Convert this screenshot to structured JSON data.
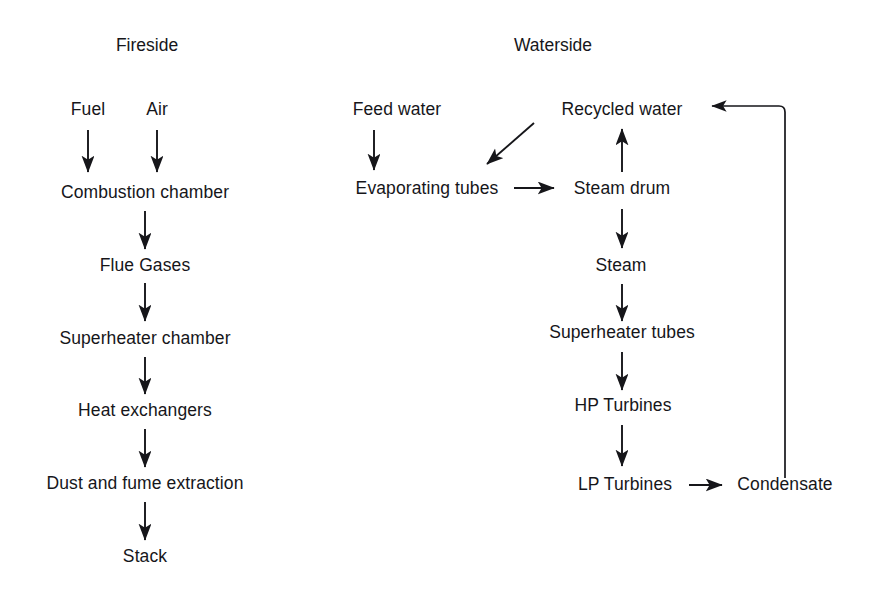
{
  "diagram": {
    "title_fireside": "Fireside",
    "title_waterside": "Waterside",
    "fireside": {
      "inputs": [
        {
          "label": "Fuel"
        },
        {
          "label": "Air"
        }
      ],
      "chain": [
        {
          "label": "Combustion chamber"
        },
        {
          "label": "Flue Gases"
        },
        {
          "label": "Superheater chamber"
        },
        {
          "label": "Heat exchangers"
        },
        {
          "label": "Dust and fume extraction"
        },
        {
          "label": "Stack"
        }
      ]
    },
    "waterside": {
      "feed": {
        "label": "Feed water"
      },
      "recycled": {
        "label": "Recycled water"
      },
      "evaporating": {
        "label": "Evaporating tubes"
      },
      "chain": [
        {
          "label": "Steam drum"
        },
        {
          "label": "Steam"
        },
        {
          "label": "Superheater tubes"
        },
        {
          "label": "HP Turbines"
        },
        {
          "label": "LP Turbines"
        }
      ],
      "condensate": {
        "label": "Condensate"
      }
    },
    "edges": [
      {
        "name": "fuel-to-combustion",
        "kind": "down-arrow"
      },
      {
        "name": "air-to-combustion",
        "kind": "down-arrow"
      },
      {
        "name": "combustion-to-flue-gases",
        "kind": "down-arrow"
      },
      {
        "name": "flue-gases-to-superheater-chamber",
        "kind": "down-arrow"
      },
      {
        "name": "superheater-chamber-to-heat-exchangers",
        "kind": "down-arrow"
      },
      {
        "name": "heat-exchangers-to-dust-extraction",
        "kind": "down-arrow"
      },
      {
        "name": "dust-extraction-to-stack",
        "kind": "down-arrow"
      },
      {
        "name": "feed-water-to-evaporating-tubes",
        "kind": "down-arrow"
      },
      {
        "name": "recycled-water-to-evaporating-tubes",
        "kind": "diagonal-arrow"
      },
      {
        "name": "evaporating-tubes-to-steam-drum",
        "kind": "right-arrow"
      },
      {
        "name": "steam-drum-to-recycled-water",
        "kind": "up-arrow"
      },
      {
        "name": "steam-drum-to-steam",
        "kind": "down-arrow"
      },
      {
        "name": "steam-to-superheater-tubes",
        "kind": "down-arrow"
      },
      {
        "name": "superheater-tubes-to-hp-turbines",
        "kind": "down-arrow"
      },
      {
        "name": "hp-turbines-to-lp-turbines",
        "kind": "down-arrow"
      },
      {
        "name": "lp-turbines-to-condensate",
        "kind": "right-arrow"
      },
      {
        "name": "condensate-to-recycled-water",
        "kind": "return-path"
      }
    ],
    "style": {
      "line_color": "#16161a",
      "background": "#ffffff"
    }
  }
}
